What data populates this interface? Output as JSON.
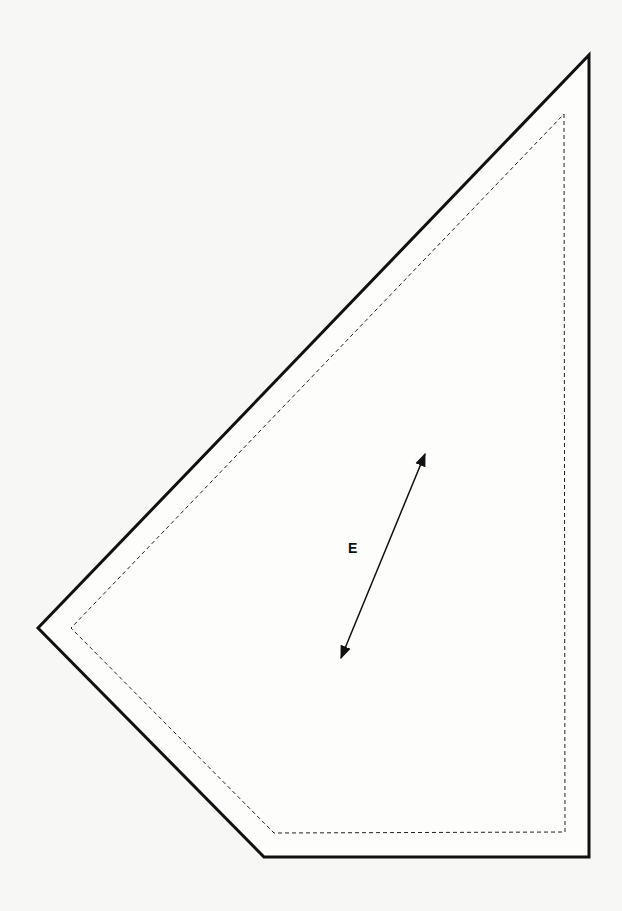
{
  "pattern_piece": {
    "label": "E",
    "line_color": "#111111",
    "background": "#f7f7f5",
    "cut_line": {
      "style": "solid",
      "points": [
        [
          589,
          55
        ],
        [
          589,
          857
        ],
        [
          264,
          857
        ],
        [
          38,
          628
        ]
      ]
    },
    "seam_line": {
      "style": "dashed",
      "points": [
        [
          564,
          114
        ],
        [
          565,
          832
        ],
        [
          274,
          833
        ],
        [
          71,
          628
        ]
      ]
    },
    "grainline": {
      "icon": "double-arrow-icon",
      "start": [
        340,
        660
      ],
      "end": [
        426,
        452
      ]
    }
  }
}
